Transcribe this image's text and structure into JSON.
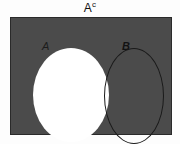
{
  "diagram": {
    "type": "venn-diagram",
    "title_base": "A",
    "title_superscript": "c",
    "title_full": "Aᶜ",
    "universe": {
      "name": "universal-set-rectangle",
      "fill_color": "#4b4b4b",
      "border_color": "#2a2a2a",
      "shaded": true
    },
    "sets": [
      {
        "label": "A",
        "name": "set-a",
        "fill_color": "#ffffff",
        "shaded": false,
        "style": "italic"
      },
      {
        "label": "B",
        "name": "set-b",
        "fill_color": "transparent",
        "outline_color": "#1a1a1a",
        "shaded": false,
        "style": "italic-bold"
      }
    ],
    "background_color": "#fdfdfd",
    "shaded_region_meaning": "A complement"
  }
}
